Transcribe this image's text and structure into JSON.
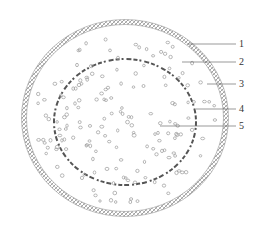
{
  "diagram": {
    "type": "cross-section",
    "outer_ring": {
      "cx": 125,
      "cy": 118,
      "rx": 101,
      "ry": 96,
      "color": "#888888"
    },
    "inner_ring": {
      "cx": 125,
      "cy": 122,
      "rx": 71,
      "ry": 63,
      "color": "#555555"
    },
    "labels": [
      {
        "id": "1",
        "text": "1",
        "line": [
          188,
          44,
          236,
          44
        ],
        "tx": 239,
        "ty": 47
      },
      {
        "id": "2",
        "text": "2",
        "line": [
          182,
          62,
          236,
          62
        ],
        "tx": 239,
        "ty": 65
      },
      {
        "id": "3",
        "text": "3",
        "line": [
          207,
          84,
          236,
          84
        ],
        "tx": 239,
        "ty": 87
      },
      {
        "id": "4",
        "text": "4",
        "line": [
          196,
          109,
          236,
          109
        ],
        "tx": 239,
        "ty": 112
      },
      {
        "id": "5",
        "text": "5",
        "line": [
          160,
          126,
          236,
          126
        ],
        "tx": 239,
        "ty": 129
      }
    ]
  }
}
